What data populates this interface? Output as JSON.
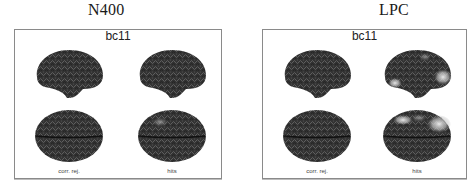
{
  "figure": {
    "panels": [
      {
        "column_title": "N400",
        "frame_title": "bc11",
        "conditions": [
          "corr. rej.",
          "hits"
        ],
        "views": [
          "lateral",
          "dorsal"
        ],
        "activation": {
          "corr_rej": "none",
          "hits": "faint left frontal"
        }
      },
      {
        "column_title": "LPC",
        "frame_title": "bc11",
        "conditions": [
          "corr. rej.",
          "hits"
        ],
        "views": [
          "lateral",
          "dorsal"
        ],
        "activation": {
          "corr_rej": "none",
          "hits": "bright posterior/parietal and temporal"
        }
      }
    ]
  },
  "colors": {
    "brain_dark": "#2b2b2b",
    "brain_mid": "#4a4a4a",
    "activation": "#e6e6e6",
    "frame_border": "#8a8a8a"
  }
}
